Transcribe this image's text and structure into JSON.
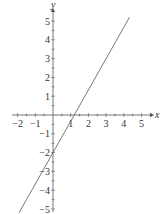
{
  "chart_data": {
    "type": "line",
    "title": "",
    "xlabel": "x",
    "ylabel": "y",
    "xlim": [
      -2.2,
      5.5
    ],
    "ylim": [
      -5.3,
      5.7
    ],
    "x_ticks": [
      -2,
      -1,
      1,
      2,
      3,
      4,
      5
    ],
    "y_ticks": [
      -5,
      -4,
      -3,
      -2,
      -1,
      1,
      2,
      3,
      4,
      5
    ],
    "x_tick_labels": [
      "−2",
      "−1",
      "1",
      "2",
      "3",
      "4",
      "5"
    ],
    "y_tick_labels": [
      "−5",
      "−4",
      "−3",
      "−2",
      "−1",
      "1",
      "2",
      "3",
      "4",
      "5"
    ],
    "minor_ticks": 0.5,
    "grid": false,
    "legend": null,
    "series": [
      {
        "name": "y = (5/3)x − 2",
        "equation": "5x - 3y = 6",
        "x": [
          -1.92,
          4.32
        ],
        "y": [
          -5.2,
          5.2
        ],
        "color": "#555555"
      }
    ],
    "annotations": []
  },
  "colors": {
    "axis": "#555555",
    "line": "#555555",
    "text": "#333333"
  }
}
